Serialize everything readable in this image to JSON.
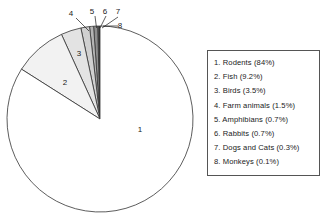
{
  "chart_data": {
    "type": "pie",
    "title": "",
    "subtitle": "",
    "xlabel": "",
    "ylabel": "",
    "legend_position": "right",
    "grid": false,
    "start_angle_deg": 90,
    "direction": "counterclockwise",
    "categories": [
      "Rodents",
      "Fish",
      "Birds",
      "Farm animals",
      "Amphibians",
      "Rabbits",
      "Dogs and Cats",
      "Monkeys"
    ],
    "values": [
      84,
      9.2,
      3.5,
      1.5,
      0.7,
      0.7,
      0.3,
      0.1
    ],
    "value_unit": "%",
    "slice_colors": [
      "#ffffff",
      "#f2f2f2",
      "#e3e3e3",
      "#d0d0d0",
      "#b4b4b4",
      "#8f8f8f",
      "#5a5a5a",
      "#1c1c1c"
    ],
    "slice_label_numbers": [
      "1",
      "2",
      "3",
      "4",
      "5",
      "6",
      "7",
      "8"
    ]
  },
  "pie": {
    "inner_labels": [
      {
        "key": "1",
        "x": 140,
        "y": 132
      },
      {
        "key": "2",
        "x": 65,
        "y": 85
      },
      {
        "key": "3",
        "x": 79,
        "y": 56
      }
    ],
    "callouts": [
      {
        "key": "4",
        "text_x": 71,
        "text_y": 16,
        "line_x1": 76,
        "line_y1": 18,
        "line_x2": 89,
        "line_y2": 31
      },
      {
        "key": "5",
        "text_x": 92,
        "text_y": 14,
        "line_x1": 95,
        "line_y1": 16,
        "line_x2": 96.5,
        "line_y2": 28
      },
      {
        "key": "6",
        "text_x": 105,
        "text_y": 14,
        "line_x1": 106,
        "line_y1": 16,
        "line_x2": 100,
        "line_y2": 28
      },
      {
        "key": "7",
        "text_x": 118,
        "text_y": 14,
        "line_x1": 118,
        "line_y1": 17,
        "line_x2": 102,
        "line_y2": 28
      },
      {
        "key": "8",
        "text_x": 120,
        "text_y": 28,
        "line_x1": 118,
        "line_y1": 26,
        "line_x2": 103,
        "line_y2": 26
      }
    ]
  },
  "legend": {
    "entries": [
      "1. Rodents (84%)",
      "2. Fish (9.2%)",
      "3. Birds (3.5%)",
      "4. Farm animals (1.5%)",
      "5. Amphibians (0.7%)",
      "6. Rabbits (0.7%)",
      "7. Dogs and Cats (0.3%)",
      "8. Monkeys (0.1%)"
    ]
  },
  "colors": {
    "outline": "#333333",
    "legend_border": "#555555",
    "text": "#1a1a1a",
    "background": "#ffffff"
  }
}
